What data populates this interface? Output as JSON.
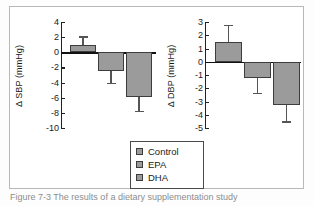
{
  "figure": {
    "background_color": "#ffffff",
    "frame_color": "#b8b8b8",
    "bar_fill_color": "#9b9b9b",
    "bar_edge_color": "#3d3d3d",
    "caption_partial": "Figure 7-3  The results of a dietary supplementation study"
  },
  "legend": {
    "items": [
      {
        "label": "Control",
        "color": "#9b9b9b"
      },
      {
        "label": "EPA",
        "color": "#9b9b9b"
      },
      {
        "label": "DHA",
        "color": "#9b9b9b"
      }
    ]
  },
  "chart_data": [
    {
      "type": "bar",
      "title": "",
      "ylabel": "Δ SBP (mmHg)",
      "xlabel": "",
      "categories": [
        "Control",
        "EPA",
        "DHA"
      ],
      "values": [
        1.0,
        -2.5,
        -5.9
      ],
      "errors": [
        1.1,
        1.5,
        1.8
      ],
      "ylim": [
        -10,
        4
      ],
      "yticks": [
        4,
        2,
        0,
        -2,
        -4,
        -6,
        -8,
        -10
      ],
      "yticklabels": [
        "4",
        "2",
        "0",
        "-2",
        "-4",
        "-6",
        "-8",
        "-10"
      ],
      "grid": false,
      "legend_position": "below"
    },
    {
      "type": "bar",
      "title": "",
      "ylabel": "Δ DBP (mmHg)",
      "xlabel": "",
      "categories": [
        "Control",
        "EPA",
        "DHA"
      ],
      "values": [
        1.5,
        -1.25,
        -3.3
      ],
      "errors": [
        1.3,
        1.1,
        1.2
      ],
      "ylim": [
        -5,
        3
      ],
      "yticks": [
        3,
        2,
        1,
        0,
        -1,
        -2,
        -3,
        -4,
        -5
      ],
      "yticklabels": [
        "3",
        "2",
        "1",
        "0",
        "-1",
        "-2",
        "-3",
        "-4",
        "-5"
      ],
      "grid": false,
      "legend_position": "below"
    }
  ]
}
